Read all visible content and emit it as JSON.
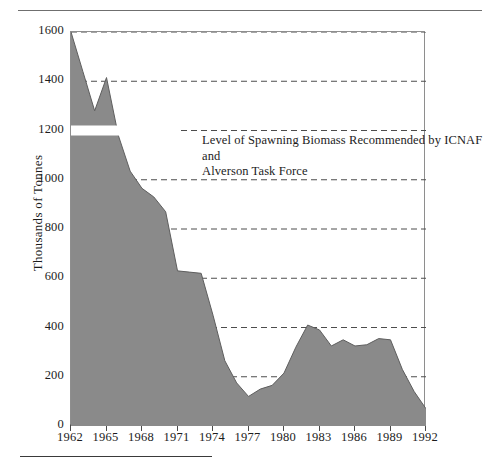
{
  "figure": {
    "name": "northern-cod-spawning-biomass-chart",
    "top_rule": true,
    "bottom_rule": true
  },
  "chart_data": {
    "type": "area",
    "title": "",
    "subtitle": "",
    "xlabel": "",
    "ylabel": "Thousands of Tonnes",
    "xlim": [
      1962,
      1992
    ],
    "ylim": [
      0,
      1600
    ],
    "grid": true,
    "grid_axis": "y",
    "legend": "none",
    "fill_color": "#8a8a8a",
    "line_color": "#5e5e5e",
    "gridline_color": "#4d4d4d",
    "axis_color": "#8e8e8e",
    "y_ticks": [
      0,
      200,
      400,
      600,
      800,
      1000,
      1200,
      1400,
      1600
    ],
    "y_tick_labels": [
      "0",
      "200",
      "400",
      "600",
      "800",
      "1000",
      "1200",
      "1400",
      "1600"
    ],
    "x_ticks": [
      1962,
      1965,
      1968,
      1971,
      1974,
      1977,
      1980,
      1983,
      1986,
      1989,
      1992
    ],
    "x_tick_labels": [
      "1962",
      "1965",
      "1968",
      "1971",
      "1974",
      "1977",
      "1980",
      "1983",
      "1986",
      "1989",
      "1992"
    ],
    "x": [
      1962,
      1963,
      1964,
      1965,
      1966,
      1967,
      1968,
      1969,
      1970,
      1971,
      1972,
      1973,
      1974,
      1975,
      1976,
      1977,
      1978,
      1979,
      1980,
      1981,
      1982,
      1983,
      1984,
      1985,
      1986,
      1987,
      1988,
      1989,
      1990,
      1991,
      1992
    ],
    "values": [
      1600,
      1440,
      1280,
      1415,
      1180,
      1035,
      965,
      930,
      870,
      630,
      625,
      620,
      450,
      265,
      175,
      120,
      150,
      165,
      215,
      320,
      410,
      390,
      325,
      350,
      325,
      330,
      355,
      350,
      230,
      140,
      70
    ],
    "series": [
      {
        "name": "Spawning biomass",
        "values": [
          1600,
          1440,
          1280,
          1415,
          1180,
          1035,
          965,
          930,
          870,
          630,
          625,
          620,
          450,
          265,
          175,
          120,
          150,
          165,
          215,
          320,
          410,
          390,
          325,
          350,
          325,
          330,
          355,
          350,
          230,
          140,
          70
        ]
      }
    ],
    "reference_line": {
      "label_line1": "Level of Spawning Biomass Recommended by ICNAF and",
      "label_line2": "Alverson Task Force",
      "value": 1200,
      "x_start": 1962,
      "x_end": 1971,
      "style": "white-band"
    },
    "annotations": [
      {
        "text_line1": "Level of Spawning Biomass Recommended by ICNAF and",
        "text_line2": "Alverson Task Force",
        "x": 1967,
        "y": 1280
      }
    ]
  }
}
